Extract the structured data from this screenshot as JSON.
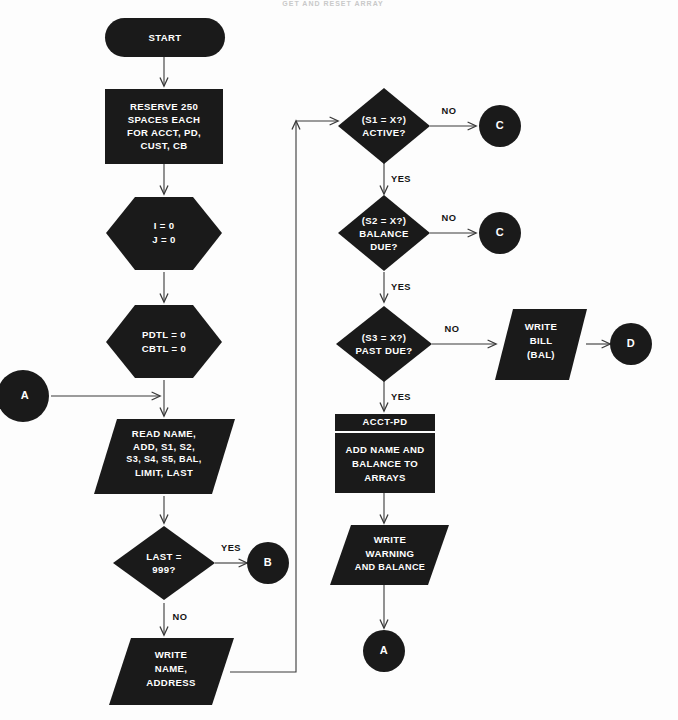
{
  "diagram": {
    "title_cropped": "GET AND RESET ARRAY",
    "background_color": "#fdfdfd",
    "shape_color": "#1a1a1a",
    "label_color": "#ffffff",
    "line_color": "#3a3a3a"
  },
  "nodes": {
    "start": {
      "label": "START",
      "shape": "terminator"
    },
    "reserve": {
      "line1": "RESERVE 250",
      "line2": "SPACES EACH",
      "line3": "FOR ACCT, PD,",
      "line4": "CUST, CB",
      "shape": "process"
    },
    "init_ij": {
      "line1": "I = 0",
      "line2": "J = 0",
      "shape": "preparation"
    },
    "init_totals": {
      "line1": "PDTL = 0",
      "line2": "CBTL = 0",
      "shape": "preparation"
    },
    "read": {
      "line1": "READ NAME,",
      "line2": "ADD, S1, S2,",
      "line3": "S3, S4, S5, BAL,",
      "line4": "LIMIT, LAST",
      "shape": "input-output"
    },
    "last_test": {
      "line1": "LAST =",
      "line2": "999?",
      "shape": "decision"
    },
    "write_name": {
      "line1": "WRITE",
      "line2": "NAME,",
      "line3": "ADDRESS",
      "shape": "input-output"
    },
    "active_test": {
      "line1": "(S1 = X?)",
      "line2": "ACTIVE?",
      "shape": "decision"
    },
    "balance_test": {
      "line1": "(S2 = X?)",
      "line2": "BALANCE",
      "line3": "DUE?",
      "shape": "decision"
    },
    "pastdue_test": {
      "line1": "(S3 = X?)",
      "line2": "PAST DUE?",
      "shape": "decision"
    },
    "write_bill": {
      "line1": "WRITE",
      "line2": "BILL",
      "line3": "(BAL)",
      "shape": "input-output"
    },
    "acct_pd": {
      "header": "ACCT-PD",
      "line1": "ADD NAME AND",
      "line2": "BALANCE TO",
      "line3": "ARRAYS",
      "shape": "predefined-process"
    },
    "write_warn": {
      "line1": "WRITE",
      "line2": "WARNING",
      "line3": "AND BALANCE",
      "shape": "input-output"
    }
  },
  "connectors": {
    "a_left": {
      "label": "A"
    },
    "b_right": {
      "label": "B"
    },
    "c_upper": {
      "label": "C"
    },
    "c_lower": {
      "label": "C"
    },
    "d_right": {
      "label": "D"
    },
    "a_bottom": {
      "label": "A"
    }
  },
  "edge_labels": {
    "last_yes": "YES",
    "last_no": "NO",
    "active_no": "NO",
    "active_yes": "YES",
    "balance_no": "NO",
    "balance_yes": "YES",
    "pastdue_no": "NO",
    "pastdue_yes": "YES"
  }
}
